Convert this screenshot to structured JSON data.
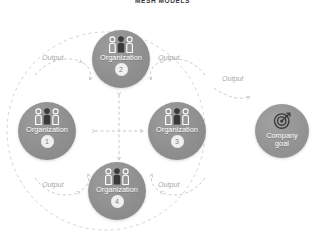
{
  "figure": {
    "title": "MESH MODELS",
    "type": "mesh-network-diagram"
  },
  "colors": {
    "node_fill": "#8f8f8f",
    "node_text": "#ffffff",
    "badge_fill": "#f0f0f0",
    "badge_text": "#7c7c7c",
    "dashed_line": "#c9c9c9",
    "output_label": "#a8a8a8",
    "title_text": "#3b3b3b",
    "background": "#ffffff"
  },
  "mesh": {
    "boundary": "dashed-circle",
    "nodes": [
      {
        "id": "org1",
        "label": "Organization",
        "badge": "1",
        "icon": "people-group-icon",
        "position": "left"
      },
      {
        "id": "org2",
        "label": "Organization",
        "badge": "2",
        "icon": "people-group-icon",
        "position": "top"
      },
      {
        "id": "org3",
        "label": "Organization",
        "badge": "3",
        "icon": "people-group-icon",
        "position": "right"
      },
      {
        "id": "org4",
        "label": "Organization",
        "badge": "4",
        "icon": "people-group-icon",
        "position": "bottom"
      }
    ],
    "center_connector": {
      "style": "dashed-cross",
      "arrows": "bidirectional",
      "connects": [
        "org1",
        "org2",
        "org3",
        "org4"
      ]
    },
    "output_arrows": [
      {
        "id": "output-tl",
        "label": "Output",
        "from": "org1",
        "to": "org2",
        "direction": "right"
      },
      {
        "id": "output-tr",
        "label": "Output",
        "from": "org3",
        "to": "org2",
        "direction": "left"
      },
      {
        "id": "output-bl",
        "label": "Output",
        "from": "org1",
        "to": "org4",
        "direction": "right"
      },
      {
        "id": "output-br",
        "label": "Output",
        "from": "org3",
        "to": "org4",
        "direction": "left"
      }
    ]
  },
  "goal": {
    "id": "goal",
    "label_line1": "Company",
    "label_line2": "goal",
    "icon": "target-bullseye-icon",
    "incoming": {
      "id": "output-goal",
      "label": "Output",
      "direction": "right"
    }
  }
}
